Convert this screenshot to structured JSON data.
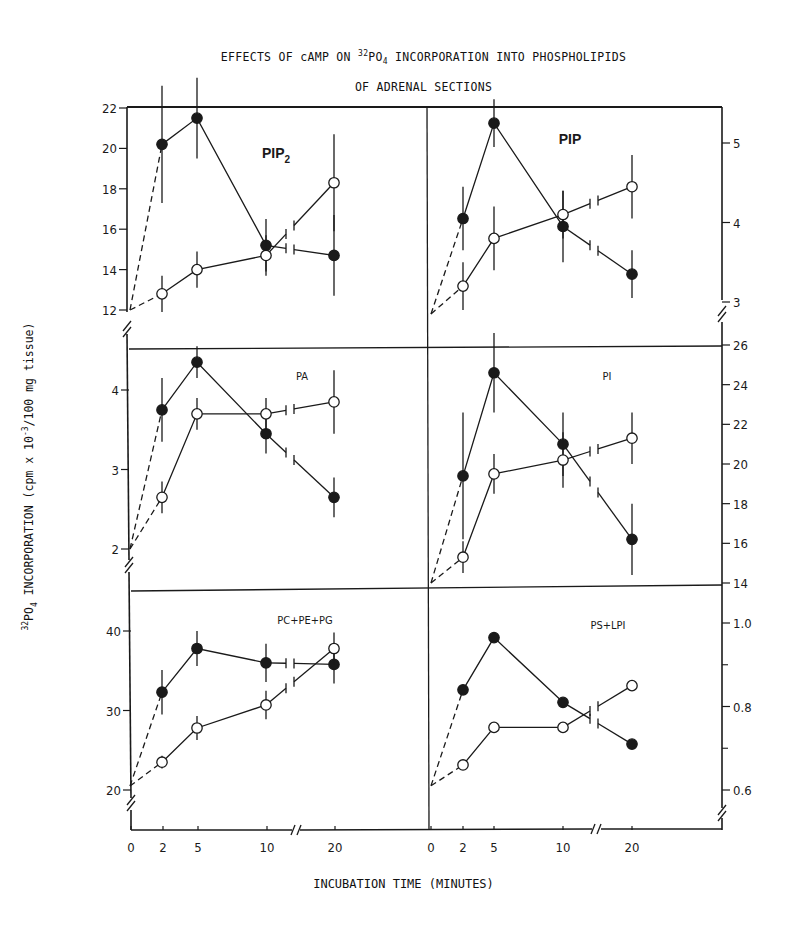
{
  "title": {
    "line1_prefix": "EFFECTS OF cAMP ON ",
    "line1_sup": "32",
    "line1_po": "PO",
    "line1_sub": "4",
    "line1_suffix": " INCORPORATION INTO PHOSPHOLIPIDS",
    "line2": "OF ADRENAL SECTIONS"
  },
  "axes": {
    "xlabel": "INCUBATION TIME (MINUTES)",
    "ylabel_sup": "32",
    "ylabel_po": "PO",
    "ylabel_sub": "4",
    "ylabel_main": " INCORPORATION (cpm x 10",
    "ylabel_exp": "-3",
    "ylabel_tail": "/100 mg tissue)",
    "x_ticks": [
      "0",
      "2",
      "5",
      "10",
      "20"
    ]
  },
  "chart_data": [
    {
      "type": "line",
      "title": "PIP2",
      "panel": "top-left",
      "x": [
        0,
        2,
        5,
        10,
        20
      ],
      "xlabel": "INCUBATION TIME (MINUTES)",
      "ylim": [
        11,
        22
      ],
      "y_ticks": [
        12,
        14,
        16,
        18,
        20,
        22
      ],
      "series": [
        {
          "name": "cAMP (filled circles)",
          "values": [
            12.0,
            20.2,
            21.5,
            15.2,
            14.7
          ],
          "errors": [
            0,
            2.9,
            2.0,
            1.3,
            2.0
          ]
        },
        {
          "name": "control (open circles)",
          "values": [
            12.0,
            12.8,
            14.0,
            14.7,
            18.3
          ],
          "errors": [
            0,
            0.9,
            0.9,
            1.0,
            2.4
          ]
        }
      ]
    },
    {
      "type": "line",
      "title": "PIP",
      "panel": "top-right",
      "x": [
        0,
        2,
        5,
        10,
        20
      ],
      "ylim": [
        2.8,
        5.5
      ],
      "y_ticks": [
        3,
        4,
        5
      ],
      "series": [
        {
          "name": "cAMP (filled circles)",
          "values": [
            2.85,
            4.05,
            5.25,
            3.95,
            3.35
          ],
          "errors": [
            0,
            0.4,
            0.3,
            0.45,
            0.3
          ]
        },
        {
          "name": "control (open circles)",
          "values": [
            2.85,
            3.2,
            3.8,
            4.1,
            4.45
          ],
          "errors": [
            0,
            0.3,
            0.4,
            0.3,
            0.4
          ]
        }
      ]
    },
    {
      "type": "line",
      "title": "PA",
      "panel": "middle-left",
      "x": [
        0,
        2,
        5,
        10,
        20
      ],
      "ylim": [
        1.5,
        4.5
      ],
      "y_ticks": [
        2,
        3,
        4
      ],
      "series": [
        {
          "name": "cAMP (filled circles)",
          "values": [
            2.0,
            3.75,
            4.35,
            3.45,
            2.65
          ],
          "errors": [
            0,
            0.4,
            0.2,
            0.25,
            0.25
          ]
        },
        {
          "name": "control (open circles)",
          "values": [
            2.0,
            2.65,
            3.7,
            3.7,
            3.85
          ],
          "errors": [
            0,
            0.2,
            0.2,
            0.2,
            0.4
          ]
        }
      ]
    },
    {
      "type": "line",
      "title": "PI",
      "panel": "middle-right",
      "x": [
        0,
        2,
        5,
        10,
        20
      ],
      "ylim": [
        14,
        26
      ],
      "y_ticks": [
        14,
        16,
        18,
        20,
        22,
        24,
        26
      ],
      "series": [
        {
          "name": "cAMP (filled circles)",
          "values": [
            14.0,
            19.4,
            24.6,
            21.0,
            16.2
          ],
          "errors": [
            0,
            3.2,
            2.0,
            1.6,
            1.8
          ]
        },
        {
          "name": "control (open circles)",
          "values": [
            14.0,
            15.3,
            19.5,
            20.2,
            21.3
          ],
          "errors": [
            0,
            0.8,
            1.0,
            1.4,
            1.3
          ]
        }
      ]
    },
    {
      "type": "line",
      "title": "PC+PE+PG",
      "panel": "bottom-left",
      "x": [
        0,
        2,
        5,
        10,
        20
      ],
      "ylim": [
        17,
        45
      ],
      "y_ticks": [
        20,
        30,
        40
      ],
      "series": [
        {
          "name": "cAMP (filled circles)",
          "values": [
            20.5,
            32.3,
            37.8,
            36.0,
            35.8
          ],
          "errors": [
            0,
            2.8,
            2.2,
            2.4,
            2.4
          ]
        },
        {
          "name": "control (open circles)",
          "values": [
            20.5,
            23.5,
            27.8,
            30.7,
            37.8
          ],
          "errors": [
            0,
            0.8,
            1.5,
            1.8,
            2.0
          ]
        }
      ]
    },
    {
      "type": "line",
      "title": "PS+LPI",
      "panel": "bottom-right",
      "x": [
        0,
        2,
        5,
        10,
        20
      ],
      "ylim": [
        0.56,
        1.1
      ],
      "y_ticks": [
        0.6,
        0.8,
        1.0
      ],
      "series": [
        {
          "name": "cAMP (filled circles)",
          "values": [
            0.61,
            0.84,
            0.965,
            0.81,
            0.71
          ],
          "errors": [
            0,
            0,
            0,
            0,
            0
          ]
        },
        {
          "name": "control (open circles)",
          "values": [
            0.61,
            0.66,
            0.75,
            0.75,
            0.85
          ],
          "errors": [
            0,
            0,
            0,
            0,
            0
          ]
        }
      ]
    }
  ]
}
